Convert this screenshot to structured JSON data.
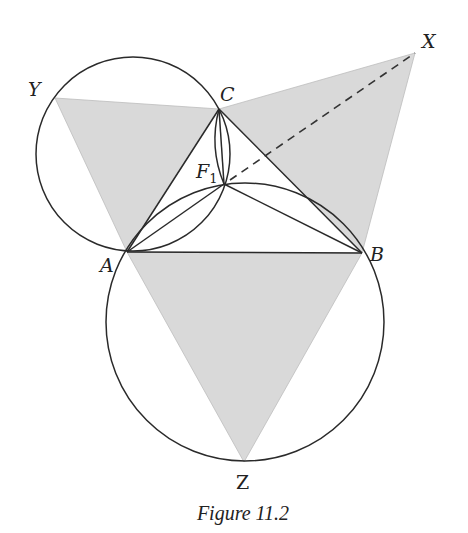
{
  "figure": {
    "caption": "Figure 11.2",
    "colors": {
      "shade": "#d9d9d9",
      "line": "#2a2a2a",
      "background": "#ffffff"
    },
    "points": {
      "A": {
        "label": "A",
        "x": 127,
        "y": 252
      },
      "B": {
        "label": "B",
        "x": 362,
        "y": 253
      },
      "C": {
        "label": "C",
        "x": 219,
        "y": 109
      },
      "F1": {
        "label": "F",
        "subscript": "1",
        "x": 224,
        "y": 184
      },
      "X": {
        "label": "X",
        "x": 415,
        "y": 53
      },
      "Y": {
        "label": "Y",
        "x": 55,
        "y": 98
      },
      "Z": {
        "label": "Z",
        "x": 244,
        "y": 462
      }
    },
    "shaded_triangles": [
      "ACY",
      "BCX",
      "ABZ"
    ],
    "circles": [
      {
        "name": "circle-ACY",
        "cx": 133,
        "cy": 154,
        "r": 97
      },
      {
        "name": "circle-ABZ",
        "cx": 245,
        "cy": 322,
        "r": 139
      },
      {
        "name": "arc-BCX",
        "cx": 332,
        "cy": 139,
        "r": 117
      }
    ],
    "segments": [
      "AB",
      "BC",
      "CA",
      "AF1",
      "BF1",
      "CF1"
    ],
    "dashed_segment": "F1X"
  }
}
